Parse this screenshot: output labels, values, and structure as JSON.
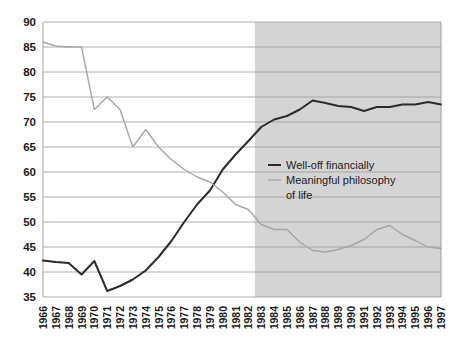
{
  "chart_data": {
    "type": "line",
    "title": "",
    "subtitle": "",
    "xlabel": "",
    "ylabel": "",
    "ylim": [
      35,
      90
    ],
    "ytick_step": 5,
    "yticks": [
      35,
      40,
      45,
      50,
      55,
      60,
      65,
      70,
      75,
      80,
      85,
      90
    ],
    "grid": true,
    "legend_position": "inside-right-middle",
    "x": [
      1966,
      1967,
      1968,
      1969,
      1970,
      1971,
      1972,
      1973,
      1974,
      1975,
      1976,
      1977,
      1978,
      1979,
      1980,
      1981,
      1982,
      1983,
      1984,
      1985,
      1986,
      1987,
      1988,
      1989,
      1990,
      1991,
      1992,
      1993,
      1994,
      1995,
      1996,
      1997
    ],
    "xtick_labels": [
      "1966",
      "1967",
      "1968",
      "1969",
      "1970",
      "1971",
      "1972",
      "1973",
      "1974",
      "1975",
      "1976",
      "1977",
      "1978",
      "1979",
      "1980",
      "1981",
      "1982",
      "1983",
      "1984",
      "1985",
      "1986",
      "1987",
      "1988",
      "1989",
      "1990",
      "1991",
      "1992",
      "1993",
      "1994",
      "1995",
      "1996",
      "1997"
    ],
    "series": [
      {
        "name": "Well-off financially",
        "color": "#2b2b2b",
        "values": [
          42.3,
          42.0,
          41.8,
          39.5,
          42.2,
          36.2,
          37.2,
          38.5,
          40.3,
          43.0,
          46.2,
          50.0,
          53.5,
          56.3,
          60.5,
          63.5,
          66.2,
          69.0,
          70.5,
          71.2,
          72.5,
          74.3,
          73.8,
          73.2,
          73.0,
          72.2,
          73.0,
          73.0,
          73.5,
          73.5,
          74.0,
          73.5
        ]
      },
      {
        "name": "Meaningful philosophy of life",
        "color": "#a6a6a6",
        "values": [
          86.0,
          85.2,
          85.0,
          85.0,
          72.5,
          75.0,
          72.5,
          65.0,
          68.5,
          65.0,
          62.5,
          60.5,
          59.0,
          58.0,
          56.0,
          53.5,
          52.5,
          49.5,
          48.5,
          48.5,
          46.0,
          44.3,
          44.0,
          44.5,
          45.3,
          46.5,
          48.5,
          49.3,
          47.5,
          46.3,
          45.0,
          44.7
        ]
      }
    ],
    "shaded_region": {
      "from": 1982.5,
      "to": 1997,
      "color": "#d4d4d4"
    },
    "legend": [
      {
        "label": "Well-off financially",
        "color": "#2b2b2b"
      },
      {
        "label": "Meaningful philosophy",
        "color": "#a6a6a6"
      },
      {
        "label": "of life",
        "color": "#a6a6a6"
      }
    ]
  }
}
